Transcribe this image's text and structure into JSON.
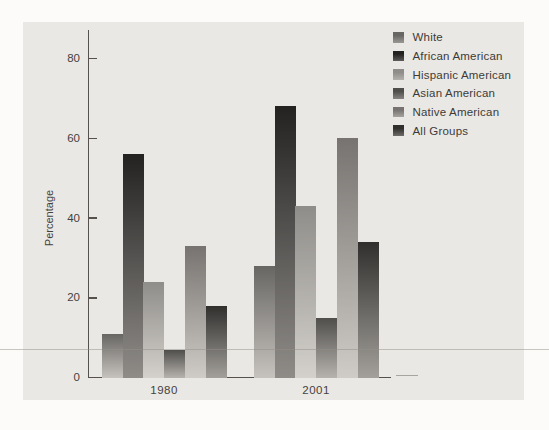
{
  "chart_data": {
    "type": "bar",
    "title": "",
    "xlabel": "",
    "ylabel": "Percentage",
    "categories": [
      "1980",
      "2001"
    ],
    "series": [
      {
        "name": "White",
        "values": [
          11,
          28
        ],
        "color_top": "#686663",
        "color_bottom": "#c6c3be"
      },
      {
        "name": "African American",
        "values": [
          56,
          68
        ],
        "color_top": "#232221",
        "color_bottom": "#8f8c88"
      },
      {
        "name": "Hispanic American",
        "values": [
          24,
          43
        ],
        "color_top": "#8f8d89",
        "color_bottom": "#d4d1cc"
      },
      {
        "name": "Asian American",
        "values": [
          7,
          15
        ],
        "color_top": "#504e4b",
        "color_bottom": "#b6b3ae"
      },
      {
        "name": "Native American",
        "values": [
          33,
          60
        ],
        "color_top": "#767370",
        "color_bottom": "#cfccc7"
      },
      {
        "name": "All Groups",
        "values": [
          18,
          34
        ],
        "color_top": "#302f2d",
        "color_bottom": "#a3a09b"
      }
    ],
    "yticks": [
      0,
      20,
      40,
      60,
      80
    ],
    "ylim": [
      0,
      87
    ],
    "grid": false,
    "legend_position": "top-right",
    "axis_color": "#55524d",
    "panel_background": "#eae8e4"
  }
}
